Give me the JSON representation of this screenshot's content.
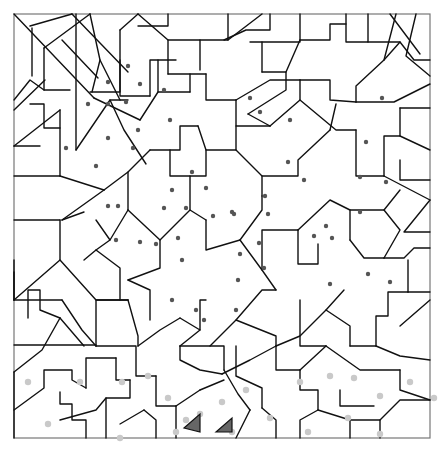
{
  "image": {
    "kind": "color-by-number mosaic line art",
    "description": "Hidden-picture dot puzzle: irregular polygons outlined in black; dark dots mark the central shape, light gray dots mark the bottom band; two gray-filled triangles near bottom center",
    "colors": {
      "background": "#ffffff",
      "lines": "#111111",
      "frame": "#777777",
      "dark_dots": "#555555",
      "light_dots": "#c9c9c9",
      "filled_triangles": "#666666"
    }
  },
  "frame": {
    "x": 14,
    "y": 14,
    "w": 416,
    "h": 424
  },
  "lines": [
    "M14,14 L94,98",
    "M30,26 L72,14",
    "M32,28 L32,76",
    "M45,80 L14,110",
    "M72,14 L128,72",
    "M44,48 L44,90 L70,90",
    "M44,48 L90,14",
    "M62,40 L98,78",
    "M76,14 L76,150",
    "M90,14 L100,60 L92,92",
    "M100,60 L120,100",
    "M120,30 L138,14",
    "M120,30 L120,96 L150,96",
    "M138,14 L168,40 L168,74",
    "M138,26 L168,26 L168,14",
    "M168,40 L200,40 L200,70",
    "M168,74 L206,74",
    "M150,96 L150,60 L176,60",
    "M200,40 L228,40 L228,14",
    "M228,40 L262,14",
    "M224,40 L246,30 L270,30 L270,14",
    "M250,42 L300,42 L300,14",
    "M262,42 L262,72",
    "M262,72 L286,72 L286,90 L248,114",
    "M286,72 L300,40",
    "M300,40 L330,40 L330,24 L346,24",
    "M346,14 L346,42 L368,42 L368,14",
    "M368,42 L400,42 L414,60 L430,60",
    "M390,14 L420,54",
    "M396,14 L384,60",
    "M400,42 L384,60 L356,86 L356,102",
    "M416,14 L406,56 L430,76",
    "M356,102 L394,102 L430,84",
    "M14,100 L30,80 L44,90",
    "M14,146 L60,110",
    "M60,110 L60,176",
    "M14,176 L60,176",
    "M14,146 L40,146",
    "M30,104 L44,104 L44,128 L60,128",
    "M76,150 L110,100 L128,100",
    "M90,92 L120,92 L120,60",
    "M94,98 L140,120",
    "M140,120 L158,92 L190,92",
    "M158,92 L158,60",
    "M190,92 L190,74",
    "M110,100 L124,130 L146,164",
    "M62,220 L104,190",
    "M62,220 L84,212",
    "M60,176 L104,190",
    "M104,190 L128,172 L150,150",
    "M128,172 L128,210",
    "M150,150 L180,150 L180,126 L198,126",
    "M198,126 L206,150 L236,150 L236,126",
    "M206,74 L206,100 L236,100",
    "M236,100 L236,126 L270,126",
    "M270,126 L300,100 L300,80",
    "M236,100 L270,80 L300,80",
    "M300,80 L330,80 L330,100 L356,102",
    "M300,100 L336,130 L356,130",
    "M248,114 L270,126",
    "M236,150 L262,176 L262,196",
    "M262,176 L298,176 L298,160 L330,130",
    "M330,130 L336,104",
    "M356,130 L356,176 L384,176",
    "M384,176 L384,136 L400,136 L400,108",
    "M400,108 L430,108",
    "M400,136 L430,150",
    "M384,176 L430,200",
    "M400,160 L400,180 L430,180",
    "M430,200 L404,232 L430,232",
    "M60,220 L60,260 L14,300",
    "M14,220 L60,220",
    "M14,260 L14,300",
    "M96,220 L110,240 L96,250 L84,260",
    "M110,240 L128,210",
    "M128,210 L160,240 L160,268 L128,280",
    "M160,240 L190,210 L206,220",
    "M190,210 L190,176 L206,176 L206,150",
    "M190,176 L170,176 L170,150",
    "M206,220 L206,250 L240,240",
    "M240,240 L262,210 L262,196",
    "M240,240 L262,270 L276,290",
    "M262,270 L262,230 L298,230",
    "M298,230 L298,264 L318,264 L318,244",
    "M298,230 L330,200 L350,210 L350,240",
    "M350,240 L364,258 L384,258",
    "M350,210 L384,210 L400,230 L384,258",
    "M384,210 L400,190",
    "M384,258 L404,258 L414,248 L430,248",
    "M128,280 L150,290 L150,320",
    "M96,250 L120,268 L120,300",
    "M60,260 L96,300 L128,300",
    "M14,300 L62,300",
    "M14,272 L14,300",
    "M28,318 L28,290 L40,290 L40,310 L60,318",
    "M62,300 L82,330 L96,346",
    "M96,346 L96,300 L128,300",
    "M128,300 L138,336 L138,346",
    "M14,372 L42,350 L60,318",
    "M14,345 L96,345",
    "M60,318 L84,346",
    "M14,410 L44,388 L44,370 L72,370 L72,380 L86,388",
    "M60,392 L60,404 L72,404 L72,420 L86,420 L86,438",
    "M86,388 L86,358 L116,358",
    "M116,358 L116,380 L130,380",
    "M14,438 L14,372",
    "M130,380 L130,398 L106,398 L106,438",
    "M106,398 L96,410 L60,420",
    "M138,346 L160,330 L180,318",
    "M180,318 L200,330 L200,300 L206,300",
    "M200,330 L180,346",
    "M180,346 L210,346 L236,320 L262,290 L276,290",
    "M236,320 L276,336 L276,346",
    "M276,346 L300,336 L326,310 L344,290",
    "M326,310 L350,326 L350,346",
    "M300,300 L300,346 L326,346",
    "M210,346 L224,346 L224,370",
    "M96,346 L136,346 L136,376 L156,376",
    "M156,376 L156,406 L176,406",
    "M176,406 L176,438",
    "M180,346 L180,360 L200,370 L222,374",
    "M222,374 L250,360 L276,346",
    "M276,346 L276,370 L300,370",
    "M300,370 L326,346",
    "M236,346 L236,376 L262,388 L262,408",
    "M262,408 L276,420 L276,438",
    "M350,346 L376,346",
    "M376,346 L376,316 L388,316 L388,292 L408,292",
    "M408,292 L430,292",
    "M408,292 L408,260",
    "M400,326 L430,300",
    "M376,346 L400,356 L430,360",
    "M326,346 L360,370 L400,370",
    "M400,370 L400,390 L430,400",
    "M300,370 L300,390 L318,390 L318,410",
    "M318,410 L300,420 L300,438",
    "M318,410 L350,420 L350,438",
    "M350,420 L380,420 L380,438",
    "M380,420 L400,400 L430,400",
    "M340,390 L340,406 L374,406",
    "M224,370 L238,394 L250,410",
    "M250,410 L236,438",
    "M200,390 L224,380",
    "M200,390 L176,406",
    "M144,410 L156,420 L156,438",
    "M120,424 L144,410"
  ],
  "dots_dark": [
    [
      128,
      66
    ],
    [
      108,
      82
    ],
    [
      140,
      84
    ],
    [
      164,
      90
    ],
    [
      88,
      104
    ],
    [
      108,
      104
    ],
    [
      126,
      102
    ],
    [
      138,
      130
    ],
    [
      108,
      138
    ],
    [
      133,
      148
    ],
    [
      170,
      120
    ],
    [
      66,
      148
    ],
    [
      96,
      166
    ],
    [
      192,
      172
    ],
    [
      206,
      188
    ],
    [
      172,
      190
    ],
    [
      108,
      206
    ],
    [
      118,
      206
    ],
    [
      164,
      208
    ],
    [
      186,
      208
    ],
    [
      213,
      216
    ],
    [
      232,
      212
    ],
    [
      250,
      98
    ],
    [
      260,
      112
    ],
    [
      290,
      120
    ],
    [
      288,
      162
    ],
    [
      265,
      196
    ],
    [
      304,
      180
    ],
    [
      382,
      98
    ],
    [
      366,
      142
    ],
    [
      360,
      177
    ],
    [
      386,
      182
    ],
    [
      360,
      212
    ],
    [
      268,
      214
    ],
    [
      234,
      214
    ],
    [
      116,
      240
    ],
    [
      140,
      242
    ],
    [
      156,
      244
    ],
    [
      178,
      238
    ],
    [
      182,
      260
    ],
    [
      172,
      300
    ],
    [
      204,
      320
    ],
    [
      196,
      310
    ],
    [
      259,
      243
    ],
    [
      240,
      254
    ],
    [
      264,
      268
    ],
    [
      236,
      310
    ],
    [
      314,
      236
    ],
    [
      326,
      226
    ],
    [
      332,
      238
    ],
    [
      330,
      284
    ],
    [
      368,
      274
    ],
    [
      390,
      282
    ],
    [
      238,
      280
    ]
  ],
  "dots_light": [
    [
      28,
      382
    ],
    [
      80,
      382
    ],
    [
      122,
      382
    ],
    [
      148,
      376
    ],
    [
      168,
      398
    ],
    [
      200,
      414
    ],
    [
      222,
      402
    ],
    [
      246,
      390
    ],
    [
      176,
      432
    ],
    [
      120,
      438
    ],
    [
      48,
      424
    ],
    [
      300,
      382
    ],
    [
      330,
      376
    ],
    [
      354,
      378
    ],
    [
      380,
      396
    ],
    [
      410,
      382
    ],
    [
      434,
      398
    ],
    [
      270,
      418
    ],
    [
      348,
      418
    ],
    [
      380,
      434
    ],
    [
      308,
      432
    ],
    [
      186,
      420
    ],
    [
      232,
      432
    ]
  ],
  "filled_triangles": [
    "M184,428 L200,414 L200,432 Z",
    "M216,432 L232,418 L232,432 Z"
  ]
}
